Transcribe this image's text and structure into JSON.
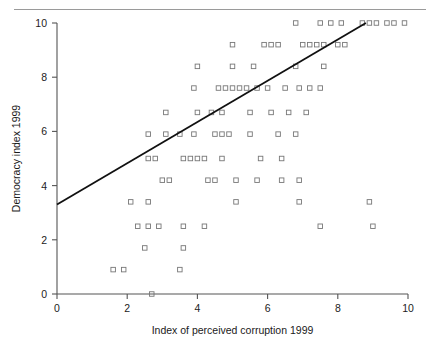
{
  "figure": {
    "background_color": "#ffffff",
    "rule_color": "#9a9a9a"
  },
  "chart_data": {
    "type": "scatter",
    "title": "",
    "xlabel": "Index of perceived corruption 1999",
    "ylabel": "Democracy index 1999",
    "xlim": [
      0,
      10
    ],
    "ylim": [
      0,
      10
    ],
    "xticks": [
      0,
      2,
      4,
      6,
      8,
      10
    ],
    "yticks": [
      0,
      2,
      4,
      6,
      8,
      10
    ],
    "xtick_labels": [
      "0",
      "2",
      "4",
      "6",
      "8",
      "10"
    ],
    "ytick_labels": [
      "0",
      "2",
      "4",
      "6",
      "8",
      "10"
    ],
    "grid": false,
    "legend": null,
    "marker": {
      "shape": "open-square",
      "size": 4.5,
      "edge_color": "#777777",
      "face_color": "none"
    },
    "trendline": {
      "type": "linear-fit",
      "color": "#111111",
      "width": 1.8,
      "x_start": 0.0,
      "y_start": 3.3,
      "x_end": 8.8,
      "y_end": 10.0,
      "slope": 0.761,
      "intercept": 3.3
    },
    "points": [
      [
        6.8,
        10.0
      ],
      [
        7.5,
        10.0
      ],
      [
        7.8,
        10.0
      ],
      [
        8.1,
        10.0
      ],
      [
        8.7,
        10.0
      ],
      [
        8.9,
        10.0
      ],
      [
        9.1,
        10.0
      ],
      [
        9.4,
        10.0
      ],
      [
        9.6,
        10.0
      ],
      [
        9.9,
        10.0
      ],
      [
        5.0,
        9.2
      ],
      [
        5.9,
        9.2
      ],
      [
        6.1,
        9.2
      ],
      [
        6.3,
        9.2
      ],
      [
        7.0,
        9.2
      ],
      [
        7.2,
        9.2
      ],
      [
        7.4,
        9.2
      ],
      [
        7.6,
        9.2
      ],
      [
        8.0,
        9.2
      ],
      [
        8.2,
        9.2
      ],
      [
        4.0,
        8.4
      ],
      [
        5.0,
        8.4
      ],
      [
        5.6,
        8.4
      ],
      [
        6.8,
        8.4
      ],
      [
        7.6,
        8.4
      ],
      [
        3.9,
        7.6
      ],
      [
        4.6,
        7.6
      ],
      [
        4.8,
        7.6
      ],
      [
        5.0,
        7.6
      ],
      [
        5.2,
        7.6
      ],
      [
        5.4,
        7.6
      ],
      [
        5.7,
        7.6
      ],
      [
        6.0,
        7.6
      ],
      [
        6.5,
        7.6
      ],
      [
        6.9,
        7.6
      ],
      [
        7.2,
        7.6
      ],
      [
        7.5,
        7.6
      ],
      [
        3.1,
        6.7
      ],
      [
        4.0,
        6.7
      ],
      [
        4.4,
        6.7
      ],
      [
        4.7,
        6.7
      ],
      [
        5.5,
        6.7
      ],
      [
        6.1,
        6.7
      ],
      [
        6.6,
        6.7
      ],
      [
        7.1,
        6.7
      ],
      [
        2.6,
        5.9
      ],
      [
        3.1,
        5.9
      ],
      [
        3.5,
        5.9
      ],
      [
        3.9,
        5.9
      ],
      [
        4.5,
        5.9
      ],
      [
        4.7,
        5.9
      ],
      [
        4.9,
        5.9
      ],
      [
        5.5,
        5.9
      ],
      [
        6.3,
        5.9
      ],
      [
        6.8,
        5.9
      ],
      [
        2.6,
        5.0
      ],
      [
        2.8,
        5.0
      ],
      [
        3.6,
        5.0
      ],
      [
        3.8,
        5.0
      ],
      [
        4.0,
        5.0
      ],
      [
        4.2,
        5.0
      ],
      [
        4.7,
        5.0
      ],
      [
        5.8,
        5.0
      ],
      [
        6.4,
        5.0
      ],
      [
        3.0,
        4.2
      ],
      [
        3.2,
        4.2
      ],
      [
        4.3,
        4.2
      ],
      [
        4.5,
        4.2
      ],
      [
        5.1,
        4.2
      ],
      [
        5.7,
        4.2
      ],
      [
        6.4,
        4.2
      ],
      [
        6.9,
        4.2
      ],
      [
        2.1,
        3.4
      ],
      [
        2.6,
        3.4
      ],
      [
        5.1,
        3.4
      ],
      [
        6.9,
        3.4
      ],
      [
        8.9,
        3.4
      ],
      [
        2.3,
        2.5
      ],
      [
        2.6,
        2.5
      ],
      [
        2.9,
        2.5
      ],
      [
        3.6,
        2.5
      ],
      [
        4.2,
        2.5
      ],
      [
        7.5,
        2.5
      ],
      [
        9.0,
        2.5
      ],
      [
        2.5,
        1.7
      ],
      [
        3.6,
        1.7
      ],
      [
        1.6,
        0.9
      ],
      [
        1.9,
        0.9
      ],
      [
        3.5,
        0.9
      ],
      [
        2.7,
        0.0
      ]
    ]
  }
}
